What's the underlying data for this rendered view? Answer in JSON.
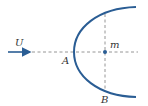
{
  "diagram": {
    "labels": {
      "flow": "U",
      "nose": "A",
      "point": "m",
      "bottom": "B"
    },
    "colors": {
      "curve": "#2a5d94",
      "arrow": "#2a5d94",
      "dashed": "#8a8a8a",
      "text": "#333333"
    }
  }
}
